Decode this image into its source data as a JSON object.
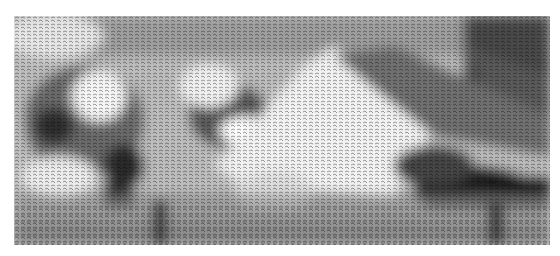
{
  "image": {
    "kind": "halftone glyph-dithered grayscale photograph",
    "description": "Grayscale scene rendered with dense small glyph dithering; a reclining figure with light-toned areas in the upper-left and center, darker shadows on the right, and a horizontal surface/platform across the bottom.",
    "palette": {
      "background": "#ffffff",
      "light": "#f2f2f2",
      "mid": "#a8a8a8",
      "dark": "#3a3a3a",
      "darkest": "#1a1a1a"
    },
    "bounds": {
      "x": 14,
      "y": 16,
      "width": 536,
      "height": 229
    }
  }
}
